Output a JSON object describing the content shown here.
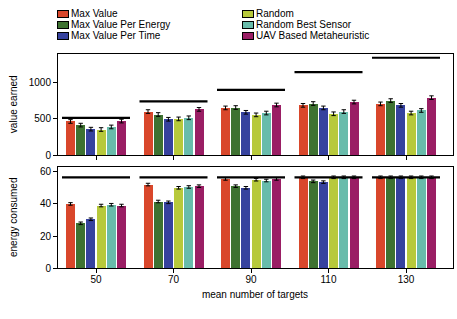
{
  "legend": {
    "items": [
      {
        "label": "Max Value",
        "color": "#d9472b"
      },
      {
        "label": "Max Value Per Energy",
        "color": "#3e7231"
      },
      {
        "label": "Max Value Per Time",
        "color": "#36429e"
      },
      {
        "label": "Random",
        "color": "#b7c93b"
      },
      {
        "label": "Random Best Sensor",
        "color": "#68bcab"
      },
      {
        "label": "UAV Based Metaheuristic",
        "color": "#9a1e64"
      }
    ]
  },
  "chart_data": [
    {
      "type": "bar",
      "title": "",
      "ylabel": "value earned",
      "xlabel": "",
      "categories": [
        50,
        70,
        90,
        110,
        130
      ],
      "yticks": [
        0,
        500,
        1000
      ],
      "ylim": [
        0,
        1400
      ],
      "grid": false,
      "legend_position": "top",
      "series": [
        {
          "name": "Max Value",
          "color": "#d9472b",
          "values": [
            465,
            600,
            650,
            685,
            705
          ]
        },
        {
          "name": "Max Value Per Energy",
          "color": "#3e7231",
          "values": [
            415,
            560,
            655,
            710,
            750
          ]
        },
        {
          "name": "Max Value Per Time",
          "color": "#36429e",
          "values": [
            360,
            495,
            590,
            650,
            685
          ]
        },
        {
          "name": "Random",
          "color": "#b7c93b",
          "values": [
            355,
            500,
            555,
            570,
            580
          ]
        },
        {
          "name": "Random Best Sensor",
          "color": "#68bcab",
          "values": [
            390,
            515,
            580,
            600,
            615
          ]
        },
        {
          "name": "UAV Based Metaheuristic",
          "color": "#9a1e64",
          "values": [
            470,
            630,
            690,
            730,
            790
          ]
        }
      ],
      "reference_lines": [
        515,
        740,
        895,
        1140,
        1335
      ],
      "error_bar": 25
    },
    {
      "type": "bar",
      "title": "",
      "ylabel": "energy consumed",
      "xlabel": "mean number of targets",
      "categories": [
        50,
        70,
        90,
        110,
        130
      ],
      "yticks": [
        0,
        20,
        40,
        60
      ],
      "ylim": [
        0,
        63.5
      ],
      "grid": false,
      "legend_position": "none",
      "series": [
        {
          "name": "Max Value",
          "color": "#d9472b",
          "values": [
            40,
            52,
            55.5,
            56.5,
            56.5
          ]
        },
        {
          "name": "Max Value Per Energy",
          "color": "#3e7231",
          "values": [
            28,
            41.5,
            51,
            54,
            56.5
          ]
        },
        {
          "name": "Max Value Per Time",
          "color": "#36429e",
          "values": [
            30.5,
            41,
            50,
            53.5,
            56.5
          ]
        },
        {
          "name": "Random",
          "color": "#b7c93b",
          "values": [
            39,
            50,
            55,
            56.5,
            56.5
          ]
        },
        {
          "name": "Random Best Sensor",
          "color": "#68bcab",
          "values": [
            39.5,
            50.5,
            54.5,
            56.5,
            56.5
          ]
        },
        {
          "name": "UAV Based Metaheuristic",
          "color": "#9a1e64",
          "values": [
            39,
            51,
            55.5,
            56.5,
            56.5
          ]
        }
      ],
      "reference_lines": [
        56.5,
        56.5,
        56.5,
        56.5,
        56.5
      ],
      "error_bar": 0.8
    }
  ]
}
